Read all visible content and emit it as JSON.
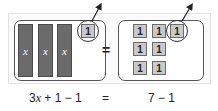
{
  "diagram": {
    "left_side": {
      "x_bars": [
        {
          "label": "x"
        },
        {
          "label": "x"
        },
        {
          "label": "x"
        }
      ],
      "unit_tiles": [
        {
          "label": "1",
          "circled": true,
          "removed": true
        }
      ]
    },
    "equals": "=",
    "right_side": {
      "unit_tiles": [
        {
          "label": "1",
          "circled": false
        },
        {
          "label": "1",
          "circled": false
        },
        {
          "label": "1",
          "circled": true,
          "removed": true
        },
        {
          "label": "1",
          "circled": false
        },
        {
          "label": "1",
          "circled": false
        },
        {
          "label": "1",
          "circled": false
        },
        {
          "label": "1",
          "circled": false
        }
      ]
    },
    "equation": {
      "left_coef": "3",
      "left_var": "x",
      "left_rest": " + 1 − 1",
      "equals": "=",
      "right": "7 − 1"
    },
    "colors": {
      "x_bar": "#6b6b6b",
      "unit_tile": "#c9c9c9",
      "outline": "#555555"
    }
  }
}
